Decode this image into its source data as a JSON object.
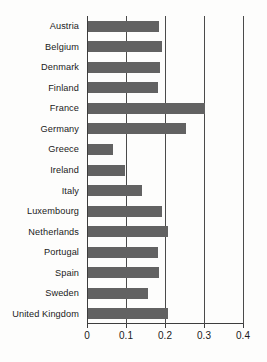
{
  "chart_data": {
    "type": "bar",
    "orientation": "horizontal",
    "title": "",
    "subtitle": "",
    "xlabel": "",
    "ylabel": "",
    "xlim": [
      0,
      0.4
    ],
    "grid": true,
    "legend": null,
    "legend_position": "none",
    "bar_color": "#626262",
    "axis_color": "#3d3d3d",
    "xticks": [
      "0",
      "0.1",
      "0.2",
      "0.3",
      "0.4"
    ],
    "xtick_values": [
      0,
      0.1,
      0.2,
      0.3,
      0.4
    ],
    "categories": [
      "Austria",
      "Belgium",
      "Denmark",
      "Finland",
      "France",
      "Germany",
      "Greece",
      "Ireland",
      "Italy",
      "Luxembourg",
      "Netherlands",
      "Portugal",
      "Spain",
      "Sweden",
      "United Kingdom"
    ],
    "values": [
      0.182,
      0.19,
      0.185,
      0.18,
      0.3,
      0.251,
      0.064,
      0.095,
      0.138,
      0.19,
      0.205,
      0.18,
      0.182,
      0.155,
      0.205
    ]
  }
}
